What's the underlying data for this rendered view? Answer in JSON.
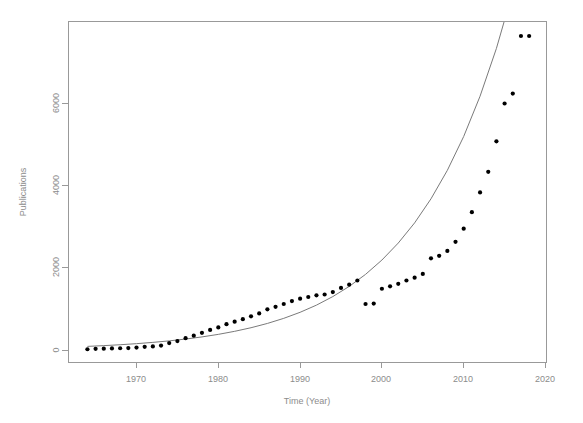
{
  "chart_data": {
    "type": "scatter",
    "title": "",
    "xlabel": "Time (Year)",
    "ylabel": "Publications",
    "xlim": [
      1963,
      2021
    ],
    "ylim": [
      -150,
      7900
    ],
    "grid": false,
    "legend": null,
    "xticks": [
      1970,
      1980,
      1990,
      2000,
      2010,
      2020
    ],
    "xtick_labels": [
      "1970",
      "1980",
      "1990",
      "2000",
      "2010",
      "2020"
    ],
    "yticks": [
      0,
      2000,
      4000,
      6000
    ],
    "ytick_labels": [
      "0",
      "2000",
      "4000",
      "6000"
    ],
    "series": [
      {
        "name": "Publications (observed)",
        "type": "scatter",
        "marker": "circle",
        "color": "#000000",
        "x": [
          1964,
          1965,
          1966,
          1967,
          1968,
          1969,
          1970,
          1971,
          1972,
          1973,
          1974,
          1975,
          1976,
          1977,
          1978,
          1979,
          1980,
          1981,
          1982,
          1983,
          1984,
          1985,
          1986,
          1987,
          1988,
          1989,
          1990,
          1991,
          1992,
          1993,
          1994,
          1995,
          1996,
          1997,
          1998,
          1999,
          2000,
          2001,
          2002,
          2003,
          2004,
          2005,
          2006,
          2007,
          2008,
          2009,
          2010,
          2011,
          2012,
          2013,
          2014,
          2015,
          2016,
          2017,
          2018
        ],
        "y": [
          30,
          40,
          45,
          50,
          55,
          60,
          70,
          90,
          100,
          120,
          180,
          230,
          300,
          360,
          430,
          500,
          560,
          640,
          700,
          760,
          830,
          900,
          1000,
          1060,
          1130,
          1200,
          1260,
          1300,
          1340,
          1360,
          1420,
          1520,
          1600,
          1700,
          1130,
          1140,
          1500,
          1560,
          1620,
          1700,
          1770,
          1860,
          2240,
          2300,
          2420,
          2640,
          2960,
          3360,
          3840,
          4340,
          5080,
          6000,
          6240,
          7640,
          7640
        ]
      },
      {
        "name": "Exponential fit",
        "type": "line",
        "color": "#7a7a7a",
        "x": [
          1964,
          1966,
          1968,
          1970,
          1972,
          1974,
          1976,
          1978,
          1980,
          1982,
          1984,
          1986,
          1988,
          1990,
          1992,
          1994,
          1996,
          1998,
          2000,
          2002,
          2004,
          2006,
          2008,
          2010,
          2012,
          2014,
          2016,
          2017
        ],
        "y": [
          100,
          118,
          140,
          166,
          197,
          234,
          278,
          330,
          392,
          466,
          553,
          657,
          781,
          928,
          1102,
          1310,
          1556,
          1849,
          2197,
          2610,
          3100,
          3684,
          4376,
          5199,
          6177,
          7338,
          8718,
          9500
        ]
      }
    ]
  },
  "axes": {
    "x_axis_name": "time-year-axis",
    "y_axis_name": "publications-axis"
  }
}
